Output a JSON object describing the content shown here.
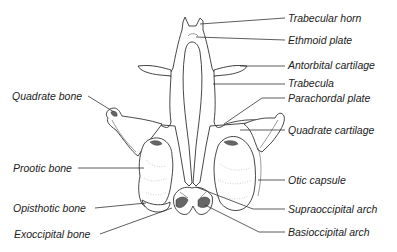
{
  "figure": {
    "line_color": "#333333",
    "label_color": "#222222",
    "labels_right": [
      {
        "id": "trabecular-horn",
        "text": "Trabecular horn"
      },
      {
        "id": "ethmoid-plate",
        "text": "Ethmoid plate"
      },
      {
        "id": "antorbital-cartilage",
        "text": "Antorbital cartilage"
      },
      {
        "id": "trabecula",
        "text": "Trabecula"
      },
      {
        "id": "parachordal-plate",
        "text": "Parachordal plate"
      },
      {
        "id": "quadrate-cartilage",
        "text": "Quadrate cartilage"
      },
      {
        "id": "otic-capsule",
        "text": "Otic capsule"
      },
      {
        "id": "supraoccipital-arch",
        "text": "Supraoccipital arch"
      },
      {
        "id": "basioccipital-arch",
        "text": "Basioccipital arch"
      }
    ],
    "labels_left": [
      {
        "id": "quadrate-bone",
        "text": "Quadrate bone"
      },
      {
        "id": "prootic-bone",
        "text": "Prootic bone"
      },
      {
        "id": "opisthotic-bone",
        "text": "Opisthotic bone"
      },
      {
        "id": "exoccipital-bone",
        "text": "Exoccipital bone"
      }
    ]
  }
}
